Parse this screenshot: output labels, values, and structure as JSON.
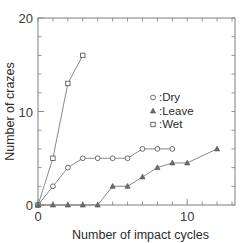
{
  "chart_data": {
    "type": "line",
    "title": "",
    "subtitle": "",
    "xlabel": "Number of impact cycles",
    "ylabel": "Number of crazes",
    "xlim": [
      0,
      13.2
    ],
    "ylim": [
      0,
      20
    ],
    "x_ticklabels": [
      "0",
      "10"
    ],
    "x_tickvalues": [
      0,
      10
    ],
    "x_minor_ticks": [
      1,
      2,
      3,
      4,
      5,
      6,
      7,
      8,
      9,
      11,
      12,
      13
    ],
    "y_ticklabels": [
      "0",
      "10",
      "20"
    ],
    "y_tickvalues": [
      0,
      10,
      20
    ],
    "y_minor_ticks": [
      2,
      4,
      6,
      8,
      12,
      14,
      16,
      18
    ],
    "grid": false,
    "frame": "box",
    "legend_position": "center-right",
    "legend": [
      {
        "label": ":Dry",
        "marker": "circle-open"
      },
      {
        "label": ":Leave",
        "marker": "triangle-filled"
      },
      {
        "label": ":Wet",
        "marker": "square-open"
      }
    ],
    "series": [
      {
        "name": ":Wet",
        "marker": "square-open",
        "x": [
          0,
          1,
          2,
          3
        ],
        "y": [
          0,
          5,
          13,
          16
        ]
      },
      {
        "name": ":Dry",
        "marker": "circle-open",
        "x": [
          0,
          1,
          2,
          3,
          4,
          5,
          6,
          7,
          8,
          9
        ],
        "y": [
          0,
          2,
          4,
          5,
          5,
          5,
          5,
          6,
          6,
          6
        ]
      },
      {
        "name": ":Leave",
        "marker": "triangle-filled",
        "x": [
          0,
          1,
          2,
          3,
          4,
          5,
          6,
          7,
          8,
          9,
          10,
          12
        ],
        "y": [
          0,
          0,
          0,
          0,
          0,
          2,
          2,
          3,
          4,
          4.5,
          4.5,
          6
        ]
      }
    ],
    "colors": {
      "axis": "#8a8a8a",
      "line": "#7c7c7c",
      "marker_edge": "#5d5d5d",
      "marker_fill": "#ffffff",
      "text": "#2b2b2b",
      "background": "#ffffff"
    }
  }
}
